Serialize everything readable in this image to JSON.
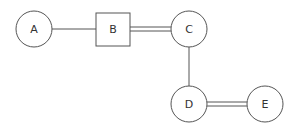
{
  "diagram": {
    "nodes": [
      {
        "id": "A",
        "label": "A",
        "shape": "circle"
      },
      {
        "id": "B",
        "label": "B",
        "shape": "square"
      },
      {
        "id": "C",
        "label": "C",
        "shape": "circle"
      },
      {
        "id": "D",
        "label": "D",
        "shape": "circle"
      },
      {
        "id": "E",
        "label": "E",
        "shape": "circle"
      }
    ],
    "edges": [
      {
        "from": "A",
        "to": "B",
        "style": "single"
      },
      {
        "from": "B",
        "to": "C",
        "style": "double"
      },
      {
        "from": "C",
        "to": "D",
        "style": "single"
      },
      {
        "from": "D",
        "to": "E",
        "style": "double"
      }
    ],
    "colors": {
      "stroke": "#555555",
      "text": "#333333",
      "background": "#ffffff"
    }
  }
}
